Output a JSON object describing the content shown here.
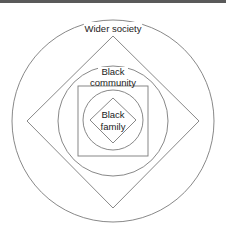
{
  "diagram": {
    "type": "nested-concentric-shapes",
    "levels": [
      {
        "name": "wider-society",
        "label": "Wider society",
        "shape": "circle"
      },
      {
        "name": "outer-diamond",
        "label": "",
        "shape": "diamond"
      },
      {
        "name": "black-community",
        "label_line1": "Black",
        "label_line2": "community",
        "shape": "circle"
      },
      {
        "name": "community-square",
        "label": "",
        "shape": "square"
      },
      {
        "name": "inner-circle",
        "label": "",
        "shape": "circle"
      },
      {
        "name": "black-family",
        "label_line1": "Black",
        "label_line2": "family",
        "shape": "diamond"
      }
    ],
    "colors": {
      "stroke": "#7a7a7a",
      "text": "#222222",
      "background": "#ffffff"
    }
  }
}
